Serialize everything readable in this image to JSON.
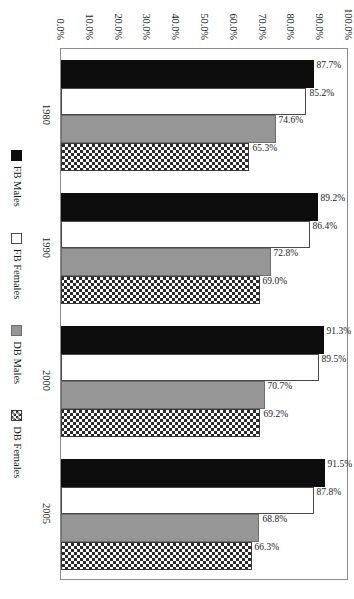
{
  "chart_data": {
    "type": "bar",
    "orientation": "rotated-90-clockwise",
    "title": "",
    "subtitle": "",
    "xlabel": "",
    "ylabel": "",
    "categories": [
      "1980",
      "1990",
      "2000",
      "2005"
    ],
    "series": [
      {
        "name": "FB Males",
        "key": "fbm",
        "color": "#0d0d0d",
        "pattern": "solid",
        "values": [
          87.7,
          89.2,
          91.3,
          91.5
        ],
        "labels": [
          "87.7%",
          "89.2%",
          "91.3%",
          "91.5%"
        ]
      },
      {
        "name": "FB Females",
        "key": "fbf",
        "color": "#ffffff",
        "pattern": "outline",
        "values": [
          85.2,
          86.4,
          89.5,
          87.8
        ],
        "labels": [
          "85.2%",
          "86.4%",
          "89.5%",
          "87.8%"
        ]
      },
      {
        "name": "DB Males",
        "key": "dbm",
        "color": "#969696",
        "pattern": "solid-gray",
        "values": [
          74.6,
          72.8,
          70.7,
          68.8
        ],
        "labels": [
          "74.6%",
          "72.8%",
          "70.7%",
          "68.8%"
        ]
      },
      {
        "name": "DB Females",
        "key": "dbf",
        "color": "#2b2b2b",
        "pattern": "crosshatch",
        "values": [
          65.3,
          69.0,
          69.2,
          66.3
        ],
        "labels": [
          "65.3%",
          "69.0%",
          "69.2%",
          "66.3%"
        ]
      }
    ],
    "ylim": [
      0,
      100
    ],
    "yticks": [
      0,
      10,
      20,
      30,
      40,
      50,
      60,
      70,
      80,
      90,
      100
    ],
    "ytick_labels": [
      "0.0%",
      "10.0%",
      "20.0%",
      "30.0%",
      "40.0%",
      "50.0%",
      "60.0%",
      "70.0%",
      "80.0%",
      "90.0%",
      "100.0%"
    ],
    "grid": false,
    "legend_position": "bottom",
    "data_labels": true
  },
  "legend": {
    "items": [
      {
        "label": "FB Males",
        "key": "fbm"
      },
      {
        "label": "FB Females",
        "key": "fbf"
      },
      {
        "label": "DB Males",
        "key": "dbm"
      },
      {
        "label": "DB Females",
        "key": "dbf"
      }
    ]
  }
}
